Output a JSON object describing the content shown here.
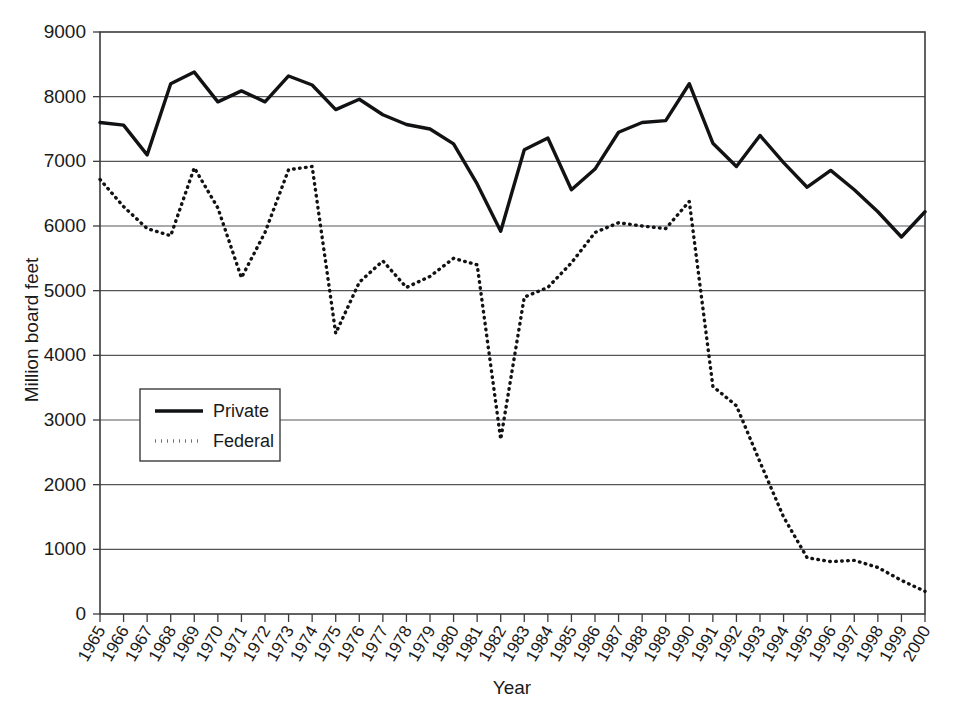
{
  "chart_data": {
    "type": "line",
    "title": "",
    "xlabel": "Year",
    "ylabel": "Million board feet",
    "ylim": [
      0,
      9000
    ],
    "ytick_step": 1000,
    "grid": true,
    "legend_position": "inner-left",
    "categories": [
      "1965",
      "1966",
      "1967",
      "1968",
      "1969",
      "1970",
      "1971",
      "1972",
      "1973",
      "1974",
      "1975",
      "1976",
      "1977",
      "1978",
      "1979",
      "1980",
      "1981",
      "1982",
      "1983",
      "1984",
      "1985",
      "1986",
      "1987",
      "1988",
      "1989",
      "1990",
      "1991",
      "1992",
      "1993",
      "1994",
      "1995",
      "1996",
      "1997",
      "1998",
      "1999",
      "2000"
    ],
    "ytick_labels": [
      "0",
      "1000",
      "2000",
      "3000",
      "4000",
      "5000",
      "6000",
      "7000",
      "8000",
      "9000"
    ],
    "series": [
      {
        "name": "Private",
        "style": "solid",
        "values": [
          7600,
          7560,
          7100,
          8200,
          8380,
          7920,
          8090,
          7920,
          8320,
          8180,
          7800,
          7960,
          7720,
          7570,
          7500,
          7270,
          6650,
          5920,
          7180,
          7360,
          6560,
          6880,
          7450,
          7600,
          7630,
          8200,
          7280,
          6920,
          7400,
          6980,
          6600,
          6860,
          6560,
          6220,
          5830,
          6220
        ]
      },
      {
        "name": "Federal",
        "style": "dotted",
        "values": [
          6720,
          6300,
          5960,
          5850,
          6900,
          6280,
          5200,
          5900,
          6870,
          6920,
          4340,
          5130,
          5460,
          5050,
          5220,
          5500,
          5400,
          2700,
          4900,
          5050,
          5430,
          5900,
          6050,
          6000,
          5960,
          6380,
          3520,
          3220,
          2350,
          1500,
          870,
          810,
          830,
          720,
          520,
          350
        ]
      }
    ]
  },
  "legend": {
    "items": [
      {
        "label": "Private",
        "style": "solid"
      },
      {
        "label": "Federal",
        "style": "dotted"
      }
    ]
  }
}
